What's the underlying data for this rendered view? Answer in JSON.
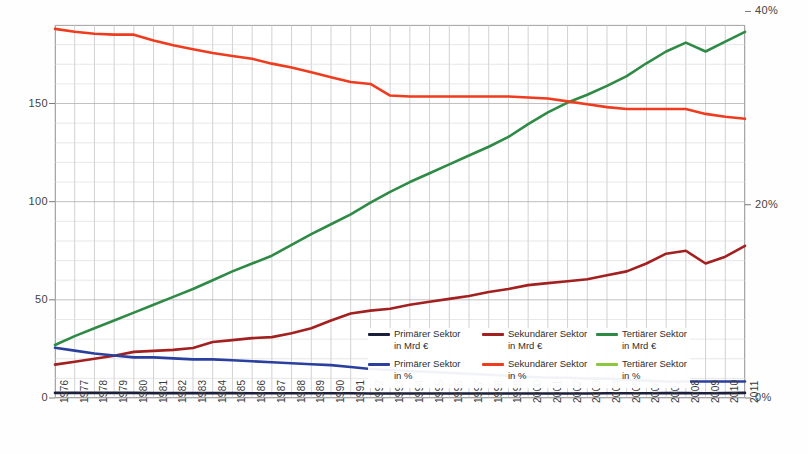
{
  "chart_data": {
    "type": "line",
    "title": "",
    "xlabel": "",
    "ylabel": "",
    "y2label": "",
    "grid": true,
    "legend_position": "inside-bottom-center",
    "ylim": [
      0,
      190
    ],
    "y2lim": [
      0,
      38.6
    ],
    "yticks": [
      "0",
      "50",
      "100",
      "150"
    ],
    "ytick_values": [
      0,
      50,
      100,
      150
    ],
    "y2ticks": [
      "0%",
      "20%",
      "40%",
      "60%"
    ],
    "y2tick_values": [
      0,
      20,
      40,
      60
    ],
    "categories": [
      "1976",
      "1977",
      "1978",
      "1979",
      "1980",
      "1981",
      "1982",
      "1983",
      "1984",
      "1985",
      "1986",
      "1987",
      "1988",
      "1989",
      "1990",
      "1991",
      "1992",
      "1993",
      "1994",
      "1995",
      "1996",
      "1997",
      "1998",
      "1999",
      "2000",
      "2001",
      "2002",
      "2003",
      "2004",
      "2005",
      "2006",
      "2007",
      "2008",
      "2009",
      "2010",
      "2011"
    ],
    "series": [
      {
        "name": "Primärer Sektor in Mrd €",
        "label_line1": "Primärer Sektor",
        "label_line2": "in Mrd €",
        "axis": "left",
        "color": "#1b1f3b",
        "values": [
          2.6,
          2.6,
          2.6,
          2.6,
          2.6,
          2.5,
          2.5,
          2.5,
          2.5,
          2.5,
          2.4,
          2.4,
          2.4,
          2.4,
          2.4,
          2.4,
          2.3,
          2.3,
          2.3,
          2.3,
          2.3,
          2.3,
          2.3,
          2.3,
          2.3,
          2.3,
          2.3,
          2.3,
          2.4,
          2.4,
          2.4,
          2.5,
          2.5,
          2.4,
          2.5,
          2.6
        ]
      },
      {
        "name": "Sekundärer Sektor in Mrd €",
        "label_line1": "Sekundärer Sektor",
        "label_line2": "in Mrd €",
        "axis": "left",
        "color": "#a32020",
        "values": [
          17.0,
          18.5,
          20.0,
          21.5,
          23.5,
          24.0,
          24.5,
          25.5,
          28.5,
          29.5,
          30.5,
          31.0,
          33.0,
          35.5,
          39.5,
          43.0,
          44.5,
          45.5,
          47.5,
          49.0,
          50.5,
          52.0,
          54.0,
          55.5,
          57.5,
          58.5,
          59.5,
          60.5,
          62.5,
          64.5,
          68.5,
          73.5,
          75.0,
          68.5,
          72.0,
          77.5
        ]
      },
      {
        "name": "Tertiärer Sektor in Mrd €",
        "label_line1": "Tertiärer Sektor",
        "label_line2": "in Mrd €",
        "axis": "left",
        "color": "#2f8a46",
        "values": [
          27.0,
          31.5,
          35.5,
          39.5,
          43.5,
          47.5,
          51.5,
          55.5,
          60.0,
          64.5,
          68.5,
          72.5,
          78.0,
          83.5,
          88.5,
          93.5,
          99.5,
          105.0,
          110.0,
          114.5,
          119.0,
          123.5,
          128.0,
          133.0,
          139.5,
          145.5,
          150.5,
          154.5,
          159.0,
          164.0,
          170.5,
          176.5,
          181.0,
          176.5,
          181.5,
          186.5
        ]
      },
      {
        "name": "Primärer Sektor in %",
        "label_line1": "Primärer Sektor",
        "label_line2": "in %",
        "axis": "right",
        "color": "#2b3f9e",
        "values": [
          5.2,
          4.9,
          4.6,
          4.4,
          4.2,
          4.2,
          4.1,
          4.0,
          4.0,
          3.9,
          3.8,
          3.7,
          3.6,
          3.5,
          3.4,
          3.2,
          3.0,
          2.9,
          2.8,
          2.7,
          2.6,
          2.5,
          2.4,
          2.3,
          2.2,
          2.1,
          2.1,
          2.0,
          2.0,
          1.9,
          1.8,
          1.7,
          1.7,
          1.7,
          1.7,
          1.7
        ]
      },
      {
        "name": "Sekundärer Sektor in %",
        "label_line1": "Sekundärer Sektor",
        "label_line2": "in %",
        "axis": "right",
        "color": "#ef3b1e",
        "values": [
          38.2,
          37.9,
          37.7,
          37.6,
          37.6,
          37.0,
          36.5,
          36.1,
          35.7,
          35.4,
          35.1,
          34.6,
          34.2,
          33.7,
          33.2,
          32.7,
          32.5,
          31.3,
          31.2,
          31.2,
          31.2,
          31.2,
          31.2,
          31.2,
          31.1,
          31.0,
          30.7,
          30.4,
          30.1,
          29.9,
          29.9,
          29.9,
          29.9,
          29.4,
          29.1,
          28.9
        ]
      },
      {
        "name": "Tertiärer Sektor in %",
        "label_line1": "Tertiärer Sektor",
        "label_line2": "in %",
        "axis": "right",
        "color": "#8dc63f",
        "values": [
          56.1,
          56.8,
          57.2,
          57.4,
          57.1,
          58.0,
          58.5,
          58.9,
          58.7,
          59.2,
          59.8,
          60.4,
          60.8,
          61.3,
          61.9,
          62.7,
          63.5,
          64.4,
          64.6,
          64.7,
          64.8,
          64.9,
          65.0,
          65.1,
          65.2,
          65.3,
          65.6,
          65.4,
          65.2,
          65.3,
          65.6,
          66.6,
          67.3,
          67.0,
          66.9,
          66.8
        ]
      }
    ]
  }
}
